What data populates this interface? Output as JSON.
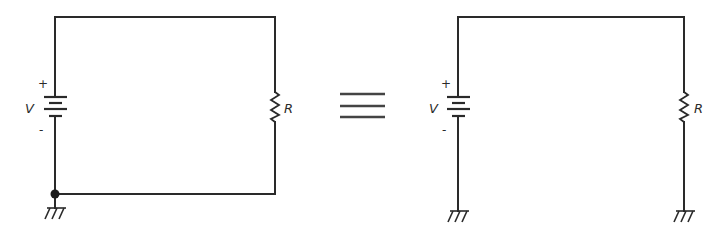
{
  "diagram": {
    "equivalence_symbol": "≡",
    "colors": {
      "stroke": "#2a2a2a",
      "background": "#ffffff"
    },
    "left_circuit": {
      "battery": {
        "label": "V",
        "positive_sign": "+",
        "negative_sign": "-"
      },
      "resistor": {
        "label": "R"
      },
      "ground_count": 1,
      "junction_dot": true
    },
    "right_circuit": {
      "battery": {
        "label": "V",
        "positive_sign": "+",
        "negative_sign": "-"
      },
      "resistor": {
        "label": "R"
      },
      "ground_count": 2,
      "junction_dot": false
    }
  }
}
